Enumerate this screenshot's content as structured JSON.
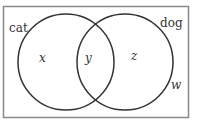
{
  "diagram": {
    "type": "venn",
    "universe": {
      "label": "w"
    },
    "sets": [
      {
        "name": "cat",
        "region_label": "x"
      },
      {
        "name": "dog",
        "region_label": "z"
      }
    ],
    "intersection_label": "y",
    "colors": {
      "stroke": "#333333",
      "border": "#888888",
      "background": "#ffffff"
    }
  }
}
